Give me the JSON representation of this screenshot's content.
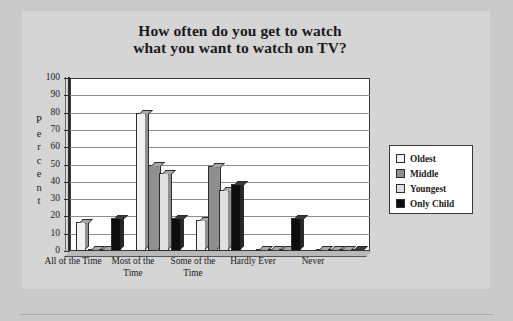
{
  "chart_data": {
    "type": "bar",
    "title": "How often do you get to watch what you want to watch on TV?",
    "title_lines": [
      "How often do you get to watch",
      "what you want to watch on TV?"
    ],
    "xlabel": "",
    "ylabel": "Percent",
    "ylim": [
      0,
      100
    ],
    "ytick_step": 10,
    "yticks": [
      "100",
      "90",
      "80",
      "70",
      "60",
      "50",
      "40",
      "30",
      "20",
      "10",
      "0"
    ],
    "grid": true,
    "legend_position": "right",
    "categories": [
      "All of the Time",
      "Most of the Time",
      "Some of the Time",
      "Hardly Ever",
      "Never"
    ],
    "category_lines": [
      [
        "All of the Time"
      ],
      [
        "Most of the",
        "Time"
      ],
      [
        "Some of the",
        "Time"
      ],
      [
        "Hardly Ever"
      ],
      [
        "Never"
      ]
    ],
    "series": [
      {
        "name": "Oldest",
        "color": "#f2f2f2",
        "values": [
          17,
          80,
          18,
          0,
          0
        ]
      },
      {
        "name": "Middle",
        "color": "#8f8f8f",
        "values": [
          0,
          50,
          49,
          0,
          0
        ]
      },
      {
        "name": "Youngest",
        "color": "#e0e0e0",
        "values": [
          0,
          45,
          35,
          0,
          0
        ]
      },
      {
        "name": "Only Child",
        "color": "#0d0d0d",
        "values": [
          19,
          19,
          39,
          19,
          1
        ]
      }
    ]
  },
  "colors": {
    "page_background": "#c9c9c9",
    "panel_background": "#d5d5d5",
    "plot_background": "#ffffff",
    "axis": "#2b2b2b",
    "gridline": "#8d8d8d",
    "text": "#1a1a1a"
  }
}
